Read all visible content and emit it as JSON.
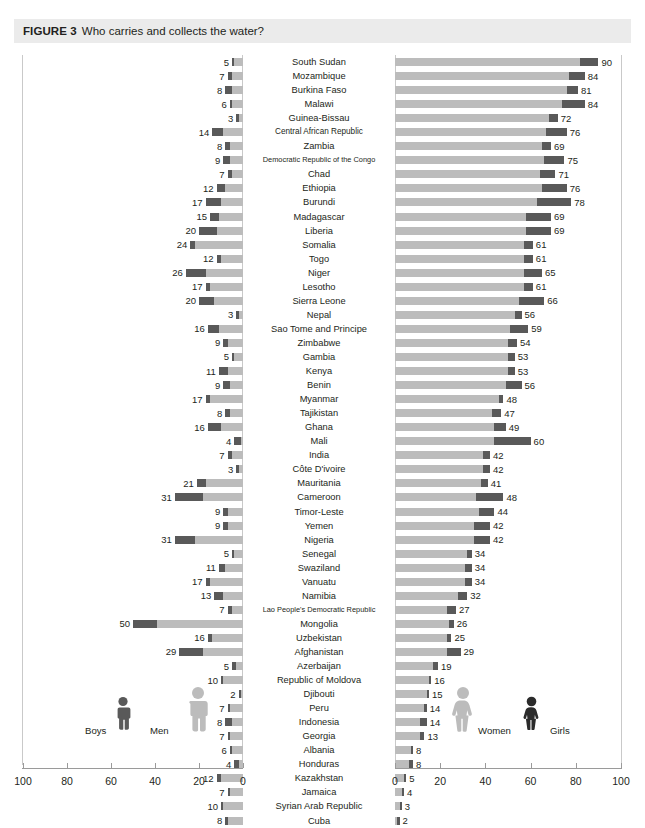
{
  "caption": {
    "figure_label": "FIGURE 3",
    "title": "Who carries and collects the water?"
  },
  "legend": {
    "boys": "Boys",
    "men": "Men",
    "women": "Women",
    "girls": "Girls"
  },
  "colors": {
    "dark": "#595959",
    "light": "#bcbcbc",
    "caption_bg": "#ebebeb",
    "grid": "#d6d6d6",
    "axis": "#9a9a9a"
  },
  "axis": {
    "left_ticks": [
      "100",
      "80",
      "60",
      "40",
      "20",
      "0"
    ],
    "right_ticks": [
      "0",
      "20",
      "40",
      "60",
      "80",
      "100"
    ],
    "max": 100
  },
  "chart_data": {
    "type": "bar",
    "title": "Who carries and collects the water?",
    "subtype": "diverging-stacked-bar",
    "xlabel": "",
    "ylabel": "",
    "xlim": [
      100,
      0,
      0,
      100
    ],
    "grid": true,
    "legend_position": "bottom-inside",
    "categories": [
      "South Sudan",
      "Mozambique",
      "Burkina Faso",
      "Malawi",
      "Guinea-Bissau",
      "Central African Republic",
      "Zambia",
      "Democratic Republic of the Congo",
      "Chad",
      "Ethiopia",
      "Burundi",
      "Madagascar",
      "Liberia",
      "Somalia",
      "Togo",
      "Niger",
      "Lesotho",
      "Sierra Leone",
      "Nepal",
      "Sao Tome and Principe",
      "Zimbabwe",
      "Gambia",
      "Kenya",
      "Benin",
      "Myanmar",
      "Tajikistan",
      "Ghana",
      "Mali",
      "India",
      "Côte D'ivoire",
      "Mauritania",
      "Cameroon",
      "Timor-Leste",
      "Yemen",
      "Nigeria",
      "Senegal",
      "Swaziland",
      "Vanuatu",
      "Namibia",
      "Lao People's Democratic Republic",
      "Mongolia",
      "Uzbekistan",
      "Afghanistan",
      "Azerbaijan",
      "Republic of Moldova",
      "Djibouti",
      "Peru",
      "Indonesia",
      "Georgia",
      "Albania",
      "Honduras",
      "Kazakhstan",
      "Jamaica",
      "Syrian Arab Republic",
      "Cuba"
    ],
    "series": [
      {
        "name": "Men and Boys (left, total label)",
        "side": "left",
        "values": [
          5,
          7,
          8,
          6,
          3,
          14,
          8,
          9,
          7,
          12,
          17,
          15,
          20,
          24,
          12,
          26,
          17,
          20,
          3,
          16,
          9,
          5,
          11,
          9,
          17,
          8,
          16,
          4,
          7,
          3,
          21,
          31,
          9,
          9,
          31,
          5,
          11,
          17,
          13,
          7,
          50,
          16,
          29,
          5,
          10,
          2,
          7,
          8,
          7,
          6,
          4,
          12,
          7,
          10,
          8
        ]
      },
      {
        "name": "Boys (dark segment within left bar)",
        "side": "left",
        "values": [
          1,
          2,
          3,
          1,
          1,
          5,
          2,
          3,
          2,
          4,
          7,
          4,
          8,
          2,
          2,
          9,
          2,
          7,
          1,
          5,
          2,
          1,
          4,
          3,
          2,
          2,
          6,
          3,
          2,
          1,
          4,
          13,
          2,
          2,
          9,
          1,
          3,
          2,
          4,
          2,
          11,
          2,
          11,
          2,
          1,
          1,
          1,
          3,
          1,
          1,
          2,
          2,
          1,
          1,
          1
        ]
      },
      {
        "name": "Women and Girls (right, total label)",
        "side": "right",
        "values": [
          90,
          84,
          81,
          84,
          72,
          76,
          69,
          75,
          71,
          76,
          78,
          69,
          69,
          61,
          61,
          65,
          61,
          66,
          56,
          59,
          54,
          53,
          53,
          56,
          48,
          47,
          49,
          60,
          42,
          42,
          41,
          48,
          44,
          42,
          42,
          34,
          34,
          34,
          32,
          27,
          26,
          25,
          29,
          19,
          16,
          15,
          14,
          14,
          13,
          8,
          8,
          5,
          4,
          3,
          2
        ]
      },
      {
        "name": "Girls (dark segment at end of right bar)",
        "side": "right",
        "values": [
          8,
          7,
          5,
          10,
          4,
          9,
          4,
          9,
          7,
          11,
          15,
          11,
          11,
          4,
          4,
          8,
          4,
          11,
          3,
          8,
          4,
          3,
          3,
          7,
          2,
          4,
          5,
          16,
          3,
          3,
          3,
          12,
          7,
          7,
          7,
          2,
          3,
          3,
          4,
          4,
          2,
          2,
          6,
          2,
          1,
          1,
          1,
          3,
          2,
          1,
          2,
          1,
          1,
          1,
          1
        ]
      }
    ],
    "left_labels": [
      "5",
      "7",
      "8",
      "6",
      "3",
      "14",
      "8",
      "9",
      "7",
      "12",
      "17",
      "15",
      "20",
      "24",
      "12",
      "26",
      "17",
      "20",
      "3",
      "16",
      "9",
      "5",
      "11",
      "9",
      "17",
      "8",
      "16",
      "4",
      "7",
      "3",
      "21",
      "31",
      "9",
      "9",
      "31",
      "5",
      "11",
      "17",
      "13",
      "7",
      "50",
      "16",
      "29",
      "5",
      "10",
      "2",
      "7",
      "8",
      "7",
      "6",
      "4",
      "12",
      "7",
      "10",
      "8"
    ],
    "right_labels": [
      "90",
      "84",
      "81",
      "84",
      "72",
      "76",
      "69",
      "75",
      "71",
      "76",
      "78",
      "69",
      "69",
      "61",
      "61",
      "65",
      "61",
      "66",
      "56",
      "59",
      "54",
      "53",
      "53",
      "56",
      "48",
      "47",
      "49",
      "60",
      "42",
      "42",
      "41",
      "48",
      "44",
      "42",
      "42",
      "34",
      "34",
      "34",
      "32",
      "27",
      "26",
      "25",
      "29",
      "19",
      "16",
      "15",
      "14",
      "14",
      "13",
      "8",
      "8",
      "5",
      "4",
      "3",
      "2"
    ]
  }
}
